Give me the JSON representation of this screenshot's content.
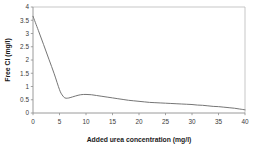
{
  "chart_data": {
    "type": "line",
    "title": "",
    "xlabel": "Added urea concentration (mg/l)",
    "ylabel": "Free Cl (mg/l)",
    "xlim": [
      0,
      40
    ],
    "ylim": [
      0,
      4
    ],
    "xticks": [
      0,
      5,
      10,
      15,
      20,
      25,
      30,
      35,
      40
    ],
    "yticks": [
      0,
      0.5,
      1,
      1.5,
      2,
      2.5,
      3,
      3.5,
      4
    ],
    "xtick_labels": [
      "0",
      "5",
      "10",
      "15",
      "20",
      "25",
      "30",
      "35",
      "40"
    ],
    "ytick_labels": [
      "0",
      "0.5",
      "1",
      "1.5",
      "2",
      "2.5",
      "3",
      "3.5",
      "4"
    ],
    "grid": false,
    "legend": false,
    "legend_position": "none",
    "line_color": "#6e6e6e",
    "frame_color": "#b9b9b9",
    "background_color": "#ffffff",
    "series": [
      {
        "name": "Free Cl",
        "x": [
          0,
          1,
          2,
          3,
          4,
          5,
          5.5,
          6,
          6.5,
          7,
          8,
          9,
          10,
          11,
          12,
          13,
          14,
          15,
          16,
          17,
          18,
          19,
          20,
          21,
          22,
          23,
          24,
          25,
          26,
          27,
          28,
          29,
          30,
          31,
          32,
          33,
          34,
          35,
          36,
          37,
          38,
          39,
          40
        ],
        "values": [
          3.65,
          3.12,
          2.58,
          2.03,
          1.48,
          0.88,
          0.68,
          0.57,
          0.56,
          0.58,
          0.64,
          0.69,
          0.7,
          0.69,
          0.66,
          0.63,
          0.6,
          0.57,
          0.54,
          0.51,
          0.48,
          0.46,
          0.44,
          0.42,
          0.4,
          0.39,
          0.38,
          0.37,
          0.36,
          0.35,
          0.34,
          0.33,
          0.32,
          0.3,
          0.29,
          0.27,
          0.25,
          0.24,
          0.22,
          0.2,
          0.18,
          0.15,
          0.12
        ]
      }
    ]
  },
  "axes": {
    "x_title": "Added urea concentration (mg/l)",
    "y_title": "Free Cl (mg/l)"
  }
}
